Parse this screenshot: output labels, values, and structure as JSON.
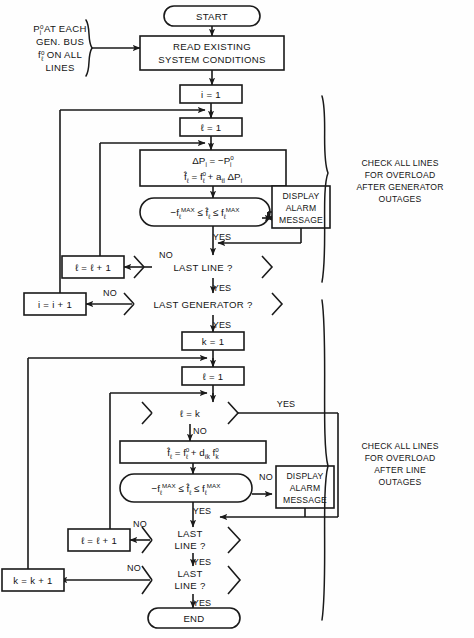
{
  "diagram": {
    "terminals": {
      "start": "START",
      "end": "END"
    },
    "input_annotation": {
      "line1_main": "P",
      "line1_sup": "o",
      "line1_sub": "i",
      "line1_rest": " AT EACH",
      "line2": "GEN. BUS",
      "line3_main": "f",
      "line3_sup": "o",
      "line3_sub": "ℓ",
      "line3_rest": " ON ALL",
      "line4": "LINES"
    },
    "process_read": {
      "line1": "READ EXISTING",
      "line2": "SYSTEM CONDITIONS"
    },
    "assign_i1": "i = 1",
    "assign_l1_top": "ℓ = 1",
    "formula_gen": {
      "l1_a": "ΔP",
      "l1_sub": "i",
      "l1_b": " = −P",
      "l1_sup": "o",
      "l1_sub2": "i",
      "l2_a": "f̂",
      "l2_sub": "ℓ",
      "l2_b": " = f",
      "l2_sup": "o",
      "l2_sub2": "ℓ",
      "l2_c": " + a",
      "l2_sub3": "ℓi",
      "l2_d": " ΔP",
      "l2_sub4": "i"
    },
    "decision_overload_gen": {
      "a": "−f",
      "a_sub": "ℓ",
      "a_max": "MAX",
      "b": " ≤ f̂",
      "b_sub": "ℓ",
      "c": " ≤ f",
      "c_sub": "ℓ",
      "c_max": "MAX"
    },
    "alarm_box_top": {
      "l1": "DISPLAY",
      "l2": "ALARM",
      "l3": "MESSAGE"
    },
    "decision_last_line_1": "LAST LINE ?",
    "decision_last_generator": "LAST GENERATOR ?",
    "assign_l_inc_top": "ℓ = ℓ + 1",
    "assign_i_inc": "i = i + 1",
    "assign_k1": "k = 1",
    "assign_l1_bot": "ℓ = 1",
    "decision_l_eq_k": "ℓ = k",
    "formula_line": {
      "a": "f̂",
      "a_sub": "ℓ",
      "b": " = f",
      "b_sup": "o",
      "b_sub": "ℓ",
      "c": " + d",
      "c_sub": "ℓk",
      "d": " f",
      "d_sup": "o",
      "d_sub": "k"
    },
    "decision_overload_line": {
      "a": "−f",
      "a_sub": "ℓ",
      "a_max": "MAX",
      "b": " ≤ f̂",
      "b_sub": "ℓ",
      "c": " ≤ f",
      "c_sub": "ℓ",
      "c_max": "MAX"
    },
    "alarm_box_bot": {
      "l1": "DISPLAY",
      "l2": "ALARM",
      "l3": "MESSAGE"
    },
    "decision_last_line_2": {
      "l1": "LAST",
      "l2": "LINE ?"
    },
    "decision_last_line_3": {
      "l1": "LAST",
      "l2": "LINE ?"
    },
    "assign_l_inc_bot": "ℓ = ℓ + 1",
    "assign_k_inc": "k = k + 1",
    "edge_labels": {
      "no": "NO",
      "yes": "YES",
      "yes1": "YES",
      "yes2": "YES",
      "yes3": "YES",
      "yes4": "YES",
      "yes5": "YES",
      "yes6": "YES",
      "yes7": "YES",
      "no1": "NO",
      "no2": "NO",
      "no3": "NO",
      "no4": "NO",
      "no5": "NO",
      "no6": "NO"
    },
    "brace_note_top": {
      "l1": "CHECK ALL LINES",
      "l2": "FOR OVERLOAD",
      "l3": "AFTER GENERATOR",
      "l4": "OUTAGES"
    },
    "brace_note_bottom": {
      "l1": "CHECK ALL LINES",
      "l2": "FOR OVERLOAD",
      "l3": "AFTER LINE",
      "l4": "OUTAGES"
    },
    "colors": {
      "stroke": "#1a1a1a",
      "fill": "#ffffff",
      "background": "#fefefe"
    }
  }
}
